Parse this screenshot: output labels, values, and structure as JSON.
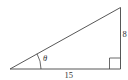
{
  "diagram": {
    "type": "right-triangle",
    "labels": {
      "angle": "θ",
      "base": "15",
      "height": "8"
    },
    "colors": {
      "stroke": "#444444",
      "text": "#333333",
      "background": "#ffffff"
    }
  }
}
